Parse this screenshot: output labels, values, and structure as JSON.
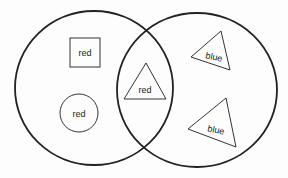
{
  "diagram": {
    "type": "venn",
    "sets": [
      {
        "id": "left",
        "label": ""
      },
      {
        "id": "right",
        "label": ""
      }
    ],
    "items": [
      {
        "shape": "square",
        "text": "red",
        "region": "left-only"
      },
      {
        "shape": "circle",
        "text": "red",
        "region": "left-only"
      },
      {
        "shape": "triangle",
        "text": "red",
        "region": "intersection"
      },
      {
        "shape": "triangle",
        "text": "blue",
        "region": "right-only"
      },
      {
        "shape": "triangle",
        "text": "blue",
        "region": "right-only"
      }
    ],
    "colors": {
      "stroke": "#222222",
      "background": "#fdfdfd"
    }
  }
}
